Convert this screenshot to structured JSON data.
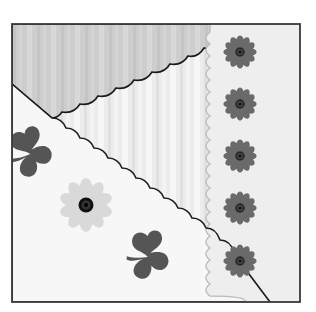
{
  "artwork": {
    "frame": {
      "x": 12,
      "y": 24,
      "width": 288,
      "height": 278,
      "border_color": "#3a3a3a"
    },
    "colors": {
      "page_bg": "#ffffff",
      "stripe_light": "#efefef",
      "stripe_mid": "#e2e2e2",
      "top_region": "#cfcfcf",
      "white_region": "#f7f7f7",
      "right_strip": "#ececec",
      "scallop_line": "#1c1c1c",
      "flower_dark": "#6a6a6a",
      "flower_center": "#1a1a1a",
      "flower_light": "#d9d9d9",
      "clover": "#555555"
    },
    "flowers_dark": [
      {
        "cx": 240,
        "cy": 52,
        "r": 17
      },
      {
        "cx": 240,
        "cy": 104,
        "r": 17
      },
      {
        "cx": 240,
        "cy": 156,
        "r": 17
      },
      {
        "cx": 240,
        "cy": 208,
        "r": 17
      },
      {
        "cx": 240,
        "cy": 261,
        "r": 17
      }
    ],
    "flower_light": {
      "cx": 86,
      "cy": 205,
      "r": 27
    },
    "clovers": [
      {
        "cx": 32,
        "cy": 152,
        "scale": 1.0
      },
      {
        "cx": 148,
        "cy": 255,
        "scale": 1.0
      }
    ]
  }
}
